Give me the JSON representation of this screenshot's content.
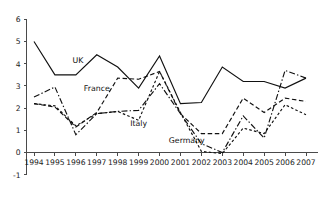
{
  "chart_data": {
    "type": "line",
    "title": "",
    "subtitle": "",
    "xlabel": "",
    "ylabel": "",
    "categories": [
      1994,
      1995,
      1996,
      1997,
      1998,
      1999,
      2000,
      2001,
      2002,
      2003,
      2004,
      2005,
      2006,
      2007
    ],
    "x_tick_labels": [
      "1994",
      "1995",
      "1996",
      "1997",
      "1998",
      "1999",
      "2000",
      "2001",
      "2002",
      "2003",
      "2004",
      "2005",
      "2006",
      "2007"
    ],
    "y_tick_labels": [
      "6",
      "5",
      "4",
      "3",
      "2",
      "1",
      "0",
      "-1"
    ],
    "y_ticks": [
      6,
      5,
      4,
      3,
      2,
      1,
      0,
      -1
    ],
    "xlim": [
      1994,
      2007
    ],
    "ylim": [
      -1,
      6
    ],
    "grid": false,
    "legend_position": "inline-annotations",
    "series": [
      {
        "name": "UK",
        "style": "solid",
        "values": [
          5.0,
          3.5,
          3.5,
          4.4,
          3.85,
          2.9,
          4.35,
          2.2,
          2.25,
          3.85,
          3.2,
          3.2,
          2.9,
          3.35
        ]
      },
      {
        "name": "France",
        "style": "dashed",
        "values": [
          2.2,
          2.05,
          1.15,
          1.8,
          3.35,
          3.3,
          3.65,
          1.75,
          0.85,
          0.85,
          2.45,
          1.8,
          2.45,
          2.3
        ]
      },
      {
        "name": "Italy",
        "style": "dash-dot",
        "values": [
          2.5,
          2.95,
          0.8,
          1.75,
          1.85,
          1.9,
          3.1,
          1.75,
          0.4,
          0.0,
          1.65,
          0.65,
          3.7,
          3.35
        ]
      },
      {
        "name": "Germany",
        "style": "short-dashed",
        "values": [
          2.2,
          2.1,
          1.2,
          1.75,
          1.85,
          1.45,
          3.65,
          1.8,
          0.05,
          -0.05,
          1.1,
          0.85,
          2.15,
          1.7
        ]
      }
    ],
    "annotations": [
      {
        "text": "UK",
        "x": 1996.1,
        "y": 4.05
      },
      {
        "text": "France",
        "x": 1997.0,
        "y": 2.78
      },
      {
        "text": "Italy",
        "x": 1999.0,
        "y": 1.18
      },
      {
        "text": "Germany",
        "x": 2001.3,
        "y": 0.42
      }
    ],
    "colors": {
      "line": "#111111",
      "axis": "#4a4a4a",
      "text": "#1a1a1a",
      "background": "#ffffff"
    }
  }
}
